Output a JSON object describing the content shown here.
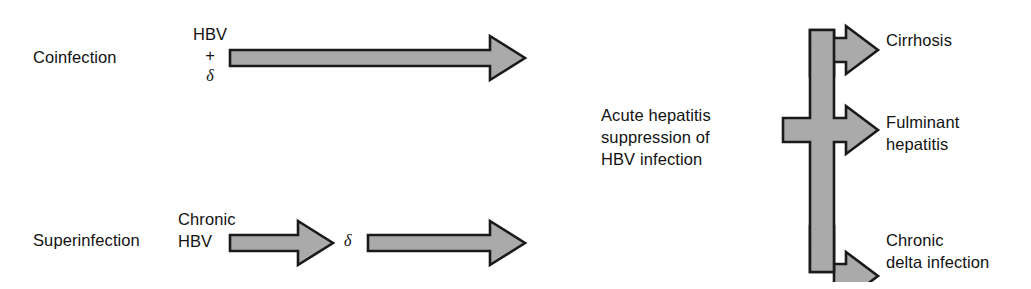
{
  "figure": {
    "background_color": "#ffffff",
    "arrow_fill_color": "#aaaaaa",
    "arrow_stroke_color": "#1a1a1a",
    "text_color": "#121212"
  },
  "rows": {
    "coinfection": {
      "label": "Coinfection",
      "agents": {
        "line1": "HBV",
        "line2": "+",
        "line3": "δ"
      },
      "arrow_name": "coinfection-arrow"
    },
    "superinfection": {
      "label": "Superinfection",
      "agents": {
        "line1": "Chronic",
        "line2": "HBV"
      },
      "delta": "δ",
      "arrow1_name": "superinfection-arrow-1",
      "arrow2_name": "superinfection-arrow-2"
    }
  },
  "middle": {
    "line1": "Acute hepatitis",
    "line2": "suppression of",
    "line3": "HBV infection"
  },
  "outcomes": [
    {
      "id": "cirrhosis",
      "line1": "Cirrhosis",
      "line2": "",
      "branch": "top"
    },
    {
      "id": "fulminant-hepatitis",
      "line1": "Fulminant",
      "line2": "hepatitis",
      "branch": "middle"
    },
    {
      "id": "chronic-delta-infection",
      "line1": "Chronic",
      "line2": "delta infection",
      "branch": "bottom"
    }
  ]
}
